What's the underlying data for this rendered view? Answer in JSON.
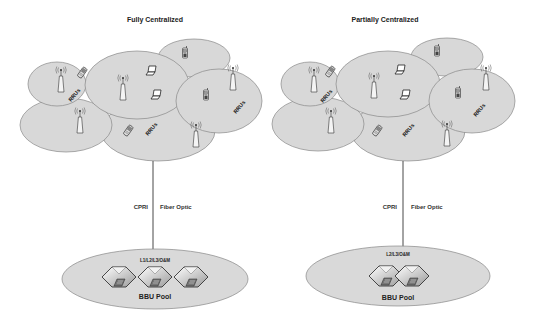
{
  "diagrams": [
    {
      "title": "Fully Centralized",
      "rru_label": "RRUs",
      "link": {
        "left_label": "CPRI",
        "right_label": "Fiber Optic"
      },
      "pool": {
        "layers_label": "L1/L2/L3/O&M",
        "label": "BBU Pool",
        "bbu_count": 3
      }
    },
    {
      "title": "Partially Centralized",
      "rru_label": "RRUs",
      "link": {
        "left_label": "CPRI",
        "right_label": "Fiber Optic"
      },
      "pool": {
        "layers_label": "L2/L3/O&M",
        "label": "BBU Pool",
        "bbu_count": 2
      }
    }
  ],
  "icons": {
    "tower": "rru-antenna-icon",
    "laptop": "laptop-icon",
    "phone": "mobile-phone-icon",
    "flip_phone": "flip-phone-icon",
    "bbu": "bbu-server-cube-icon"
  },
  "colors": {
    "cell_fill": "#d8d8d8",
    "cell_stroke": "#888888",
    "line": "#333333",
    "text": "#222222"
  }
}
